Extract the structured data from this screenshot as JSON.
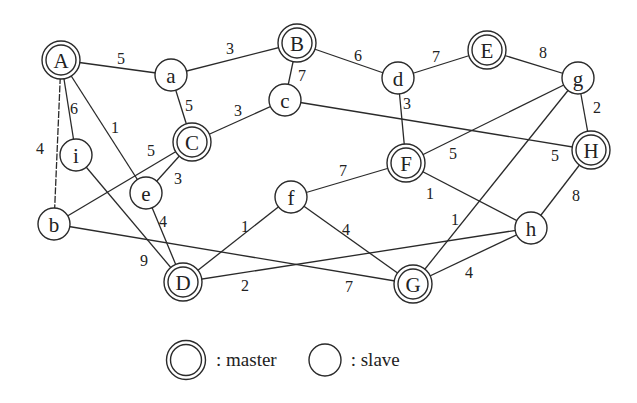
{
  "diagram": {
    "type": "weighted-graph",
    "nodes": [
      {
        "id": "A",
        "role": "master",
        "x": 61,
        "y": 60
      },
      {
        "id": "a",
        "role": "slave",
        "x": 171,
        "y": 75
      },
      {
        "id": "B",
        "role": "master",
        "x": 297,
        "y": 43
      },
      {
        "id": "d",
        "role": "slave",
        "x": 398,
        "y": 78
      },
      {
        "id": "E",
        "role": "master",
        "x": 487,
        "y": 50
      },
      {
        "id": "g",
        "role": "slave",
        "x": 578,
        "y": 78
      },
      {
        "id": "c",
        "role": "slave",
        "x": 285,
        "y": 100
      },
      {
        "id": "C",
        "role": "master",
        "x": 192,
        "y": 142
      },
      {
        "id": "i",
        "role": "slave",
        "x": 76,
        "y": 155
      },
      {
        "id": "H",
        "role": "master",
        "x": 591,
        "y": 150
      },
      {
        "id": "F",
        "role": "master",
        "x": 406,
        "y": 163
      },
      {
        "id": "e",
        "role": "slave",
        "x": 146,
        "y": 193
      },
      {
        "id": "b",
        "role": "slave",
        "x": 54,
        "y": 224
      },
      {
        "id": "f",
        "role": "slave",
        "x": 291,
        "y": 197
      },
      {
        "id": "h",
        "role": "slave",
        "x": 531,
        "y": 228
      },
      {
        "id": "D",
        "role": "master",
        "x": 183,
        "y": 282
      },
      {
        "id": "G",
        "role": "master",
        "x": 413,
        "y": 284
      }
    ],
    "edges": [
      {
        "from": "A",
        "to": "a",
        "weight": "5",
        "lx": 121,
        "ly": 58
      },
      {
        "from": "a",
        "to": "B",
        "weight": "3",
        "lx": 230,
        "ly": 48
      },
      {
        "from": "B",
        "to": "d",
        "weight": "6",
        "lx": 358,
        "ly": 55
      },
      {
        "from": "d",
        "to": "E",
        "weight": "7",
        "lx": 436,
        "ly": 56
      },
      {
        "from": "E",
        "to": "g",
        "weight": "8",
        "lx": 543,
        "ly": 52
      },
      {
        "from": "B",
        "to": "c",
        "weight": "7",
        "lx": 302,
        "ly": 75
      },
      {
        "from": "a",
        "to": "C",
        "weight": "5",
        "lx": 189,
        "ly": 105
      },
      {
        "from": "C",
        "to": "c",
        "weight": "3",
        "lx": 238,
        "ly": 110
      },
      {
        "from": "A",
        "to": "i",
        "weight": "6",
        "lx": 74,
        "ly": 108
      },
      {
        "from": "A",
        "to": "e",
        "weight": "1",
        "lx": 115,
        "ly": 127
      },
      {
        "from": "A",
        "to": "b",
        "weight": "4",
        "lx": 40,
        "ly": 148,
        "dashed": true
      },
      {
        "from": "i",
        "to": "D",
        "weight": "9",
        "lx": 144,
        "ly": 260
      },
      {
        "from": "b",
        "to": "C",
        "weight": "5",
        "lx": 151,
        "ly": 150
      },
      {
        "from": "e",
        "to": "C",
        "weight": "3",
        "lx": 178,
        "ly": 178
      },
      {
        "from": "e",
        "to": "D",
        "weight": "4",
        "lx": 163,
        "ly": 221
      },
      {
        "from": "c",
        "to": "H",
        "weight": "5",
        "lx": 555,
        "ly": 155
      },
      {
        "from": "d",
        "to": "F",
        "weight": "3",
        "lx": 407,
        "ly": 103
      },
      {
        "from": "g",
        "to": "F",
        "weight": "5",
        "lx": 453,
        "ly": 153
      },
      {
        "from": "g",
        "to": "H",
        "weight": "2",
        "lx": 597,
        "ly": 107
      },
      {
        "from": "g",
        "to": "G",
        "weight": "1",
        "lx": 455,
        "ly": 219
      },
      {
        "from": "F",
        "to": "f",
        "weight": "7",
        "lx": 343,
        "ly": 170
      },
      {
        "from": "F",
        "to": "h",
        "weight": "1",
        "lx": 430,
        "ly": 193
      },
      {
        "from": "H",
        "to": "h",
        "weight": "8",
        "lx": 576,
        "ly": 195
      },
      {
        "from": "f",
        "to": "D",
        "weight": "1",
        "lx": 245,
        "ly": 226
      },
      {
        "from": "f",
        "to": "G",
        "weight": "4",
        "lx": 346,
        "ly": 229
      },
      {
        "from": "D",
        "to": "h",
        "weight": "2",
        "lx": 245,
        "ly": 285
      },
      {
        "from": "b",
        "to": "G",
        "weight": "7",
        "lx": 349,
        "ly": 286
      },
      {
        "from": "G",
        "to": "h",
        "weight": "4",
        "lx": 469,
        "ly": 272
      }
    ]
  },
  "legend": {
    "master_label": ": master",
    "slave_label": ": slave"
  },
  "colors": {
    "stroke": "#2a2a2a",
    "background": "#ffffff",
    "text": "#222222"
  }
}
